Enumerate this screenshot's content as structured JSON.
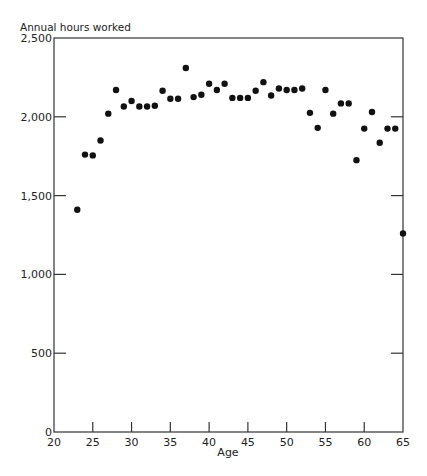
{
  "chart_data": {
    "type": "scatter",
    "title": "",
    "ylabel": "Annual hours worked",
    "xlabel": "Age",
    "xlim": [
      20,
      65
    ],
    "ylim": [
      0,
      2500
    ],
    "x_ticks": [
      20,
      25,
      30,
      35,
      40,
      45,
      50,
      55,
      60,
      65
    ],
    "x_tick_labels": [
      "20",
      "25",
      "30",
      "35",
      "40",
      "45",
      "50",
      "55",
      "60",
      "65"
    ],
    "y_ticks": [
      0,
      500,
      1000,
      1500,
      2000,
      2500
    ],
    "y_tick_labels": [
      "0",
      "500",
      "1,000",
      "1,500",
      "2,000",
      "2,500"
    ],
    "grid": false,
    "legend": null,
    "series": [
      {
        "name": "Annual hours worked",
        "points": [
          {
            "x": 23,
            "y": 1410
          },
          {
            "x": 24,
            "y": 1760
          },
          {
            "x": 25,
            "y": 1755
          },
          {
            "x": 26,
            "y": 1850
          },
          {
            "x": 27,
            "y": 2020
          },
          {
            "x": 28,
            "y": 2170
          },
          {
            "x": 29,
            "y": 2065
          },
          {
            "x": 30,
            "y": 2100
          },
          {
            "x": 31,
            "y": 2065
          },
          {
            "x": 32,
            "y": 2065
          },
          {
            "x": 33,
            "y": 2070
          },
          {
            "x": 34,
            "y": 2165
          },
          {
            "x": 35,
            "y": 2115
          },
          {
            "x": 36,
            "y": 2115
          },
          {
            "x": 37,
            "y": 2310
          },
          {
            "x": 38,
            "y": 2125
          },
          {
            "x": 39,
            "y": 2140
          },
          {
            "x": 40,
            "y": 2210
          },
          {
            "x": 41,
            "y": 2170
          },
          {
            "x": 42,
            "y": 2210
          },
          {
            "x": 43,
            "y": 2120
          },
          {
            "x": 44,
            "y": 2120
          },
          {
            "x": 45,
            "y": 2120
          },
          {
            "x": 46,
            "y": 2165
          },
          {
            "x": 47,
            "y": 2220
          },
          {
            "x": 48,
            "y": 2135
          },
          {
            "x": 49,
            "y": 2180
          },
          {
            "x": 50,
            "y": 2170
          },
          {
            "x": 51,
            "y": 2170
          },
          {
            "x": 52,
            "y": 2180
          },
          {
            "x": 53,
            "y": 2025
          },
          {
            "x": 54,
            "y": 1930
          },
          {
            "x": 55,
            "y": 2170
          },
          {
            "x": 56,
            "y": 2020
          },
          {
            "x": 57,
            "y": 2085
          },
          {
            "x": 58,
            "y": 2085
          },
          {
            "x": 59,
            "y": 1725
          },
          {
            "x": 60,
            "y": 1925
          },
          {
            "x": 61,
            "y": 2030
          },
          {
            "x": 62,
            "y": 1835
          },
          {
            "x": 63,
            "y": 1925
          },
          {
            "x": 64,
            "y": 1925
          },
          {
            "x": 65,
            "y": 1260
          }
        ]
      }
    ]
  },
  "colors": {
    "points": "#111111",
    "axes": "#333333",
    "background": "#ffffff"
  }
}
